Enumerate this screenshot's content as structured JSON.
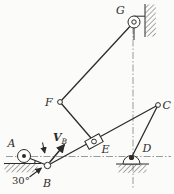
{
  "figure": {
    "labels": {
      "A": "A",
      "B": "B",
      "C": "C",
      "D": "D",
      "E": "E",
      "F": "F",
      "G": "G"
    },
    "angle_label": "30°",
    "velocity_label": {
      "symbol": "V",
      "subscript": "B"
    },
    "colors": {
      "line": "#2e2c29",
      "centerline": "#8f8f8c",
      "background": "#fbfbf9"
    }
  }
}
